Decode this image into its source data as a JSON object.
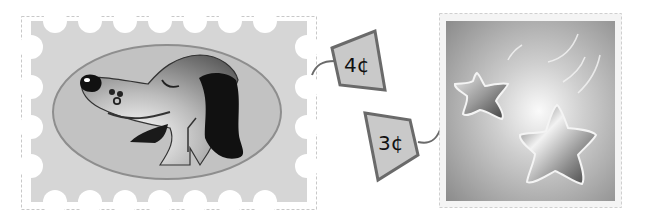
{
  "stamps": [
    {
      "id": "dog-stamp",
      "subject": "dog",
      "price_label": "4¢",
      "style": "perforated",
      "colors": {
        "background": "#d4d4d4",
        "oval": "#bdbdbd",
        "oval_border": "#8a8a8a",
        "ear": "#111111"
      }
    },
    {
      "id": "star-stamp",
      "subject": "shooting stars",
      "price_label": "3¢",
      "style": "bordered",
      "colors": {
        "background": "#9a9a9a",
        "glow": "#f4f4f4",
        "border": "#e0e0e0"
      }
    }
  ],
  "tags": {
    "tag_4c": "4¢",
    "tag_3c": "3¢",
    "fill": "#c8c8c8",
    "stroke": "#6a6a6a"
  }
}
